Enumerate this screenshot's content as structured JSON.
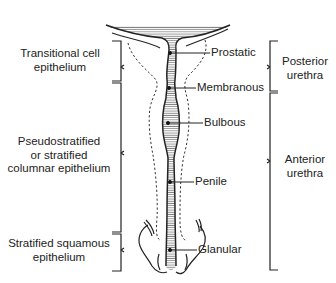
{
  "diagram": {
    "left_brackets": [
      {
        "line1": "Transitional cell",
        "line2": "epithelium",
        "line3": ""
      },
      {
        "line1": "Pseudostratified",
        "line2": "or stratified",
        "line3": "columnar epithelium"
      },
      {
        "line1": "Stratified squamous",
        "line2": "epithelium",
        "line3": ""
      }
    ],
    "right_brackets": [
      {
        "line1": "Posterior",
        "line2": "urethra"
      },
      {
        "line1": "Anterior",
        "line2": "urethra"
      }
    ],
    "segments": [
      {
        "label": "Prostatic"
      },
      {
        "label": "Membranous"
      },
      {
        "label": "Bulbous"
      },
      {
        "label": "Penile"
      },
      {
        "label": "Glanular"
      }
    ],
    "colors": {
      "ink": "#222222",
      "background": "#ffffff",
      "hatch": "#555555"
    }
  }
}
